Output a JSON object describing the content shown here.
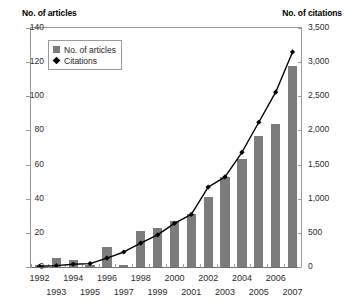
{
  "chart_data": {
    "type": "bar",
    "title": "",
    "subtitle": "",
    "xlabel": "",
    "ylabel": "No. of articles",
    "y2label": "No. of citations",
    "grid": false,
    "legend_position": "top-left",
    "categories": [
      "1992",
      "1993",
      "1994",
      "1995",
      "1996",
      "1997",
      "1998",
      "1999",
      "2000",
      "2001",
      "2002",
      "2003",
      "2004",
      "2005",
      "2006",
      "2007"
    ],
    "ylim": [
      0,
      140
    ],
    "yticks": [
      0,
      20,
      40,
      60,
      80,
      100,
      120,
      140
    ],
    "ytick_labels": [
      "0",
      "20",
      "40",
      "60",
      "80",
      "100",
      "120",
      "140"
    ],
    "y2lim": [
      0,
      3500
    ],
    "y2ticks": [
      0,
      500,
      1000,
      1500,
      2000,
      2500,
      3000,
      3500
    ],
    "y2tick_labels": [
      "0",
      "500",
      "1,000",
      "1,500",
      "2,000",
      "2,500",
      "3,000",
      "3,500"
    ],
    "series": [
      {
        "name": "No. of articles",
        "type": "bar",
        "axis": "left",
        "color": "#7c7c7c",
        "values": [
          1,
          5,
          4,
          1,
          12,
          1,
          21,
          23,
          27,
          31,
          41,
          53,
          63,
          77,
          84,
          118
        ]
      },
      {
        "name": "Citations",
        "type": "line",
        "axis": "right",
        "color": "#000000",
        "marker": "diamond",
        "values": [
          10,
          20,
          40,
          50,
          130,
          220,
          350,
          470,
          640,
          770,
          1170,
          1320,
          1680,
          2120,
          2560,
          3150
        ]
      }
    ],
    "legend_entries": [
      "No. of articles",
      "Citations"
    ]
  },
  "axis_titles": {
    "left": "No. of articles",
    "right": "No. of citations"
  },
  "xaxis": {
    "row_top": [
      "1992",
      "1994",
      "1996",
      "1998",
      "2000",
      "2002",
      "2004",
      "2006"
    ],
    "row_bottom": [
      "1993",
      "1995",
      "1997",
      "1999",
      "2001",
      "2003",
      "2005",
      "2007"
    ]
  }
}
